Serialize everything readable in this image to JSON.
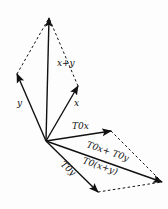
{
  "diagram": {
    "colors": {
      "stroke": "#111111",
      "background": "#fdfdfd"
    },
    "origin": [
      46,
      141
    ],
    "vectors": [
      {
        "id": "x",
        "label": "x",
        "tip": [
          78,
          86
        ],
        "style": "solid"
      },
      {
        "id": "y",
        "label": "y",
        "tip": [
          17,
          74
        ],
        "style": "solid"
      },
      {
        "id": "x_plus_y",
        "label": "x+y",
        "tip": [
          49,
          18
        ],
        "style": "solid"
      },
      {
        "id": "T0x",
        "label": "T0x",
        "tip": [
          111,
          131
        ],
        "style": "solid"
      },
      {
        "id": "T0y",
        "label": "T0y",
        "tip": [
          98,
          192
        ],
        "style": "solid"
      },
      {
        "id": "T0x_plus_T0y",
        "label": "T0x+ T0y",
        "label2": "T0(x+y)",
        "tip": [
          162,
          182
        ],
        "style": "solid"
      }
    ],
    "labels": {
      "x": "x",
      "y": "y",
      "x_plus_y": "x+y",
      "T0x": "T0x",
      "T0y": "T0y",
      "T0x_plus_T0y": "T0x+ T0y",
      "T0_of_sum": "T0(x+y)"
    },
    "dashed_edges": [
      {
        "from": [
          17,
          74
        ],
        "to": [
          49,
          18
        ]
      },
      {
        "from": [
          78,
          86
        ],
        "to": [
          49,
          18
        ]
      },
      {
        "from": [
          111,
          131
        ],
        "to": [
          162,
          182
        ]
      },
      {
        "from": [
          98,
          192
        ],
        "to": [
          162,
          182
        ]
      }
    ]
  }
}
